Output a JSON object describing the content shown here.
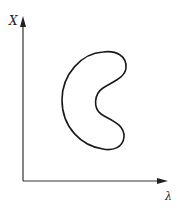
{
  "diagram": {
    "y_axis_label": "X",
    "x_axis_label": "λ",
    "curve": "closed kidney-shaped region",
    "stroke_color": "#1a1a1a"
  }
}
